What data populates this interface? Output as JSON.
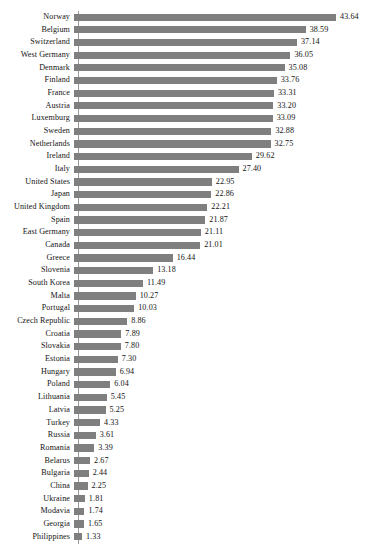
{
  "chart_data": {
    "type": "bar",
    "orientation": "horizontal",
    "title": "",
    "subtitle": "",
    "xlabel": "",
    "ylabel": "",
    "xlim": [
      0,
      43.64
    ],
    "grid": false,
    "legend": null,
    "bar_color": "#7f7f7f",
    "axis_color": "#9a9a9a",
    "value_label_format": "0.00",
    "categories": [
      "Norway",
      "Belgium",
      "Switzerland",
      "West Germany",
      "Denmark",
      "Finland",
      "France",
      "Austria",
      "Luxemburg",
      "Sweden",
      "Netherlands",
      "Ireland",
      "Italy",
      "United States",
      "Japan",
      "United Kingdom",
      "Spain",
      "East Germany",
      "Canada",
      "Greece",
      "Slovenia",
      "South Korea",
      "Malta",
      "Portugal",
      "Czech Republic",
      "Croatia",
      "Slovakia",
      "Estonia",
      "Hungary",
      "Poland",
      "Lithuania",
      "Latvia",
      "Turkey",
      "Russia",
      "Romania",
      "Belarus",
      "Bulgaria",
      "China",
      "Ukraine",
      "Modavia",
      "Georgia",
      "Philippines"
    ],
    "values": [
      43.64,
      38.59,
      37.14,
      36.05,
      35.08,
      33.76,
      33.31,
      33.2,
      33.09,
      32.88,
      32.75,
      29.62,
      27.4,
      22.95,
      22.86,
      22.21,
      21.87,
      21.11,
      21.01,
      16.44,
      13.18,
      11.49,
      10.27,
      10.03,
      8.86,
      7.89,
      7.8,
      7.3,
      6.94,
      6.04,
      5.45,
      5.25,
      4.33,
      3.61,
      3.39,
      2.67,
      2.44,
      2.25,
      1.81,
      1.74,
      1.65,
      1.33
    ],
    "value_labels": [
      "43.64",
      "38.59",
      "37.14",
      "36.05",
      "35.08",
      "33.76",
      "33.31",
      "33.20",
      "33.09",
      "32.88",
      "32.75",
      "29.62",
      "27.40",
      "22.95",
      "22.86",
      "22.21",
      "21.87",
      "21.11",
      "21.01",
      "16.44",
      "13.18",
      "11.49",
      "10.27",
      "10.03",
      "8.86",
      "7.89",
      "7.80",
      "7.30",
      "6.94",
      "6.04",
      "5.45",
      "5.25",
      "4.33",
      "3.61",
      "3.39",
      "2.67",
      "2.44",
      "2.25",
      "1.81",
      "1.74",
      "1.65",
      "1.33"
    ]
  }
}
